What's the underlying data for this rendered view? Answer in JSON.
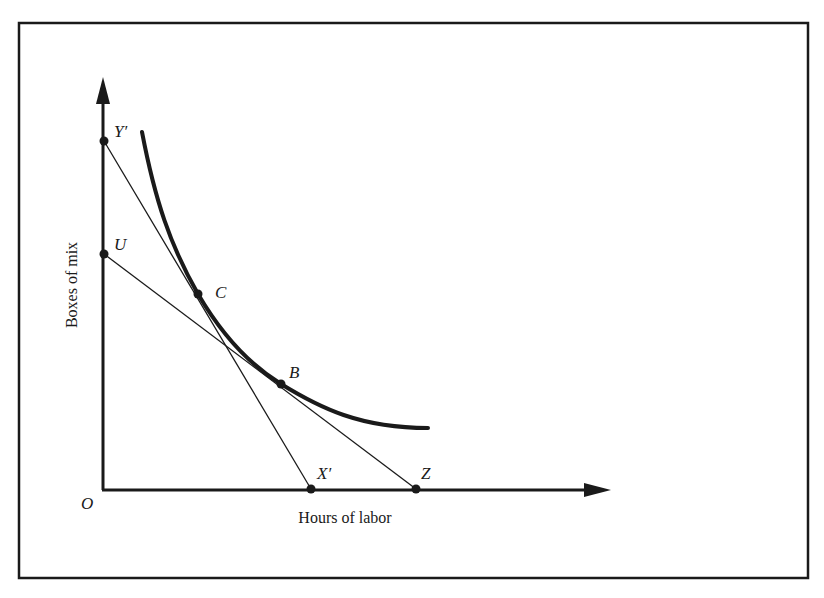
{
  "figure": {
    "type": "isoquant diagram",
    "x_axis_label": "Hours of labor",
    "y_axis_label": "Boxes of mix",
    "origin_label": "O",
    "colors": {
      "ink": "#1a1a1a",
      "background": "#ffffff"
    }
  },
  "points": {
    "y_prime": {
      "label": "Y′"
    },
    "u": {
      "label": "U"
    },
    "c": {
      "label": "C"
    },
    "b": {
      "label": "B"
    },
    "x_prime": {
      "label": "X′"
    },
    "z": {
      "label": "Z"
    }
  },
  "lines": [
    {
      "name": "isocost-y-prime-x-prime",
      "from": "Y′",
      "to": "X′",
      "tangent_at": "C"
    },
    {
      "name": "isocost-u-z",
      "from": "U",
      "to": "Z",
      "tangent_at": "B"
    }
  ],
  "curve": {
    "name": "isoquant",
    "passes_through": [
      "C",
      "B"
    ]
  }
}
